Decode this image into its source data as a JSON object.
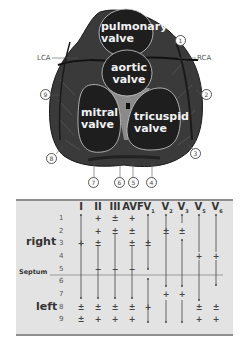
{
  "diagram": {
    "valves": {
      "pulmonary": [
        "pulmonary",
        "valve"
      ],
      "aortic": [
        "aortic",
        "valve"
      ],
      "mitral": [
        "mitral",
        "valve"
      ],
      "tricuspid": [
        "tricuspid",
        "valve"
      ]
    },
    "arteries": {
      "left": "LCA",
      "right": "RCA"
    },
    "callouts": [
      "1",
      "2",
      "3",
      "4",
      "5",
      "6",
      "7",
      "8",
      "9"
    ]
  },
  "table": {
    "leads": [
      "I",
      "II",
      "III",
      "AVF",
      "V",
      "V",
      "V",
      "V",
      "V"
    ],
    "lead_subscripts": [
      "",
      "",
      "",
      "",
      "1",
      "2",
      "3",
      "5",
      "6"
    ],
    "rows": [
      "1",
      "2",
      "3",
      "4",
      "5",
      "6",
      "7",
      "8",
      "9"
    ],
    "side_labels": {
      "right": "right",
      "septum": "Septum",
      "left": "left"
    },
    "symbols": {
      "I": [
        "",
        "",
        "+",
        "",
        "",
        "",
        "",
        "±",
        "±"
      ],
      "II": [
        "+",
        "+",
        "±",
        "",
        "−",
        "",
        "",
        "±",
        "+"
      ],
      "III": [
        "±",
        "±",
        "",
        "",
        "−",
        "",
        "",
        "±",
        "+"
      ],
      "AVF": [
        "+",
        "±",
        "±",
        "",
        "−",
        "",
        "",
        "±",
        "+"
      ],
      "V1": [
        "",
        "",
        "±",
        "",
        "",
        "",
        "",
        "+",
        ""
      ],
      "V2": [
        "",
        "±",
        "",
        "",
        "",
        "",
        "+",
        "",
        ""
      ],
      "V3": [
        "",
        "±",
        "",
        "",
        "",
        "",
        "+",
        "",
        ""
      ],
      "V5": [
        "",
        "",
        "",
        "+",
        "",
        "",
        "",
        "±",
        "+"
      ],
      "V6": [
        "",
        "",
        "",
        "+",
        "",
        "",
        "",
        "±",
        "+"
      ]
    }
  },
  "colors": {
    "heart_dark": "#2a2a2a",
    "heart_mid": "#4a4a4a",
    "septum_gray": "#8a8a8a",
    "valve_fill": "#1e1e1e",
    "table_bg": "#e3e3e3",
    "table_border": "#8e8e8e"
  }
}
